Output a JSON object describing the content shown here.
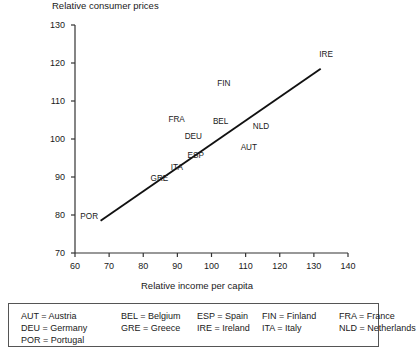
{
  "chart_data": {
    "type": "scatter",
    "title": "Relative consumer prices",
    "xlabel": "Relative income per capita",
    "ylabel": "Relative consumer prices",
    "xlim": [
      60,
      140
    ],
    "ylim": [
      70,
      130
    ],
    "xticks": [
      "60",
      "70",
      "80",
      "90",
      "100",
      "110",
      "120",
      "130",
      "140"
    ],
    "yticks": [
      "70",
      "80",
      "90",
      "100",
      "110",
      "120",
      "130"
    ],
    "grid": false,
    "legend_position": "below-plot",
    "point_label_style": "text-only",
    "points": [
      {
        "code": "POR",
        "name": "Portugal",
        "x": 68,
        "y": 79.5
      },
      {
        "code": "GRE",
        "name": "Greece",
        "x": 88,
        "y": 90.5
      },
      {
        "code": "ITA",
        "name": "Italy",
        "x": 91,
        "y": 92.5
      },
      {
        "code": "ESP",
        "name": "Spain",
        "x": 93,
        "y": 94.5
      },
      {
        "code": "DEU",
        "name": "Germany",
        "x": 98,
        "y": 101.5
      },
      {
        "code": "FRA",
        "name": "France",
        "x": 95,
        "y": 104.5
      },
      {
        "code": "BEL",
        "name": "Belgium",
        "x": 101,
        "y": 104
      },
      {
        "code": "AUT",
        "name": "Austria",
        "x": 110,
        "y": 100
      },
      {
        "code": "NLD",
        "name": "Netherlands",
        "x": 113,
        "y": 103
      },
      {
        "code": "FIN",
        "name": "Finland",
        "x": 104,
        "y": 114.5
      },
      {
        "code": "IRE",
        "name": "Ireland",
        "x": 131,
        "y": 120.5
      }
    ],
    "trendline": {
      "x0": 67.5,
      "y0": 78.5,
      "x1": 132,
      "y1": 118.5
    }
  },
  "legend": {
    "entries": [
      {
        "code": "AUT",
        "text": "AUT = Austria"
      },
      {
        "code": "BEL",
        "text": "BEL = Belgium"
      },
      {
        "code": "ESP",
        "text": "ESP = Spain"
      },
      {
        "code": "FIN",
        "text": "FIN = Finland"
      },
      {
        "code": "FRA",
        "text": "FRA = France"
      },
      {
        "code": "DEU",
        "text": "DEU = Germany"
      },
      {
        "code": "GRE",
        "text": "GRE = Greece"
      },
      {
        "code": "IRE",
        "text": "IRE = Ireland"
      },
      {
        "code": "ITA",
        "text": "ITA = Italy"
      },
      {
        "code": "NLD",
        "text": "NLD = Netherlands"
      },
      {
        "code": "POR",
        "text": "POR = Portugal"
      }
    ]
  },
  "colors": {
    "axis": "#333333",
    "trendline": "#111111",
    "text": "#1a1a1a",
    "legend_border": "#555555",
    "background": "#ffffff"
  }
}
